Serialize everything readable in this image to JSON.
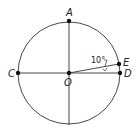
{
  "diagram": {
    "points": {
      "A": "A",
      "C": "C",
      "O": "O",
      "D": "D",
      "E": "E"
    },
    "angle_label": "10°",
    "colors": {
      "stroke": "#222222",
      "background": "#ffffff"
    }
  }
}
